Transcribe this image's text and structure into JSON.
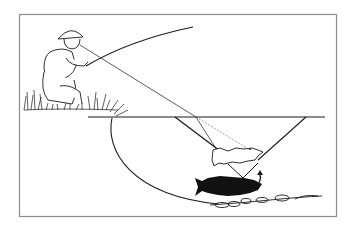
{
  "figure": {
    "description": "Illustration of an angler kneeling on a grassy bank fishing; diagram shows water surface, the trout's cone of vision (Snell's window), the line of sight from the angler's eye refracted at the surface, a real fish (black) and its apparent image (white outline) higher in the water, and rocks on the stream bed.",
    "elements": {
      "angler": "angler kneeling in grass holding fly rod",
      "rod": "fly rod",
      "sight_line": "line of sight from angler's eye",
      "water_surface": "water surface line",
      "vision_cone": "fish's cone of vision",
      "apparent_fish": "apparent (refracted) fish image",
      "real_fish": "actual fish",
      "arrow": "curved arrow between apparent and real fish",
      "bank": "stream bank curve",
      "rocks": "stream-bed stones"
    },
    "colors": {
      "ink": "#1a1a1a",
      "frame": "#8c8c8c",
      "background": "#ffffff",
      "dashed_line": "#777777"
    }
  }
}
